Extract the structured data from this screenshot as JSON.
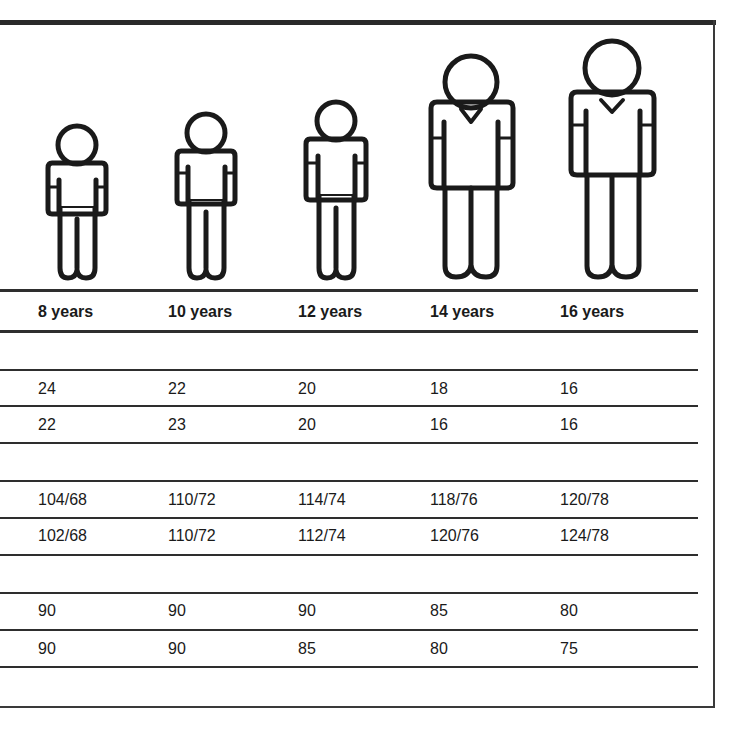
{
  "columns": [
    {
      "age": "8 years"
    },
    {
      "age": "10 years"
    },
    {
      "age": "12 years"
    },
    {
      "age": "14 years"
    },
    {
      "age": "16 years"
    }
  ],
  "figures": [
    {
      "name": "child-8-years",
      "style": "round-neck"
    },
    {
      "name": "child-10-years",
      "style": "round-neck"
    },
    {
      "name": "child-12-years",
      "style": "round-neck"
    },
    {
      "name": "teen-14-years",
      "style": "v-neck"
    },
    {
      "name": "teen-16-years",
      "style": "v-neck"
    }
  ],
  "sections": [
    {
      "rows": [
        [
          "24",
          "22",
          "20",
          "18",
          "16"
        ],
        [
          "22",
          "23",
          "20",
          "16",
          "16"
        ]
      ]
    },
    {
      "rows": [
        [
          "104/68",
          "110/72",
          "114/74",
          "118/76",
          "120/78"
        ],
        [
          "102/68",
          "110/72",
          "112/74",
          "120/76",
          "124/78"
        ]
      ]
    },
    {
      "rows": [
        [
          "90",
          "90",
          "90",
          "85",
          "80"
        ],
        [
          "90",
          "90",
          "85",
          "80",
          "75"
        ]
      ]
    }
  ],
  "colors": {
    "ink": "#1a1a1a",
    "rule": "#2e2e2e",
    "background": "#ffffff"
  }
}
